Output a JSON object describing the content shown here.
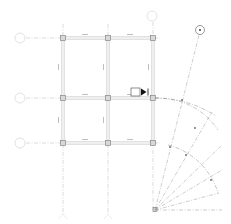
{
  "drawing": {
    "type": "structural-grid-plan",
    "colors": {
      "grid_line": "#b8b8b8",
      "beam": "#c8c8c8",
      "column": "#8a8a8a",
      "bubble": "#cccccc",
      "marker": "#222222",
      "radial": "#9a9a9a"
    },
    "grid_rows": [
      {
        "id": "row-1",
        "label": "",
        "y": 38
      },
      {
        "id": "row-2",
        "label": "",
        "y": 98
      },
      {
        "id": "row-3",
        "label": "",
        "y": 143
      }
    ],
    "grid_columns": [
      {
        "id": "col-1",
        "label": "",
        "x": 63
      },
      {
        "id": "col-2",
        "label": "",
        "x": 108
      },
      {
        "id": "col-3",
        "label": "",
        "x": 153
      }
    ],
    "top_bubble": {
      "label": "",
      "x": 153,
      "y": 16
    },
    "rotated_bubble": {
      "label": "•",
      "x": 200,
      "y": 30
    },
    "beam_labels": {
      "top_left": "—",
      "top_right": "—",
      "mid_left": "—",
      "mid_right": "—",
      "bottom_left": "—",
      "bottom_right": "—"
    },
    "section_marker": {
      "label": "",
      "x": 133,
      "y": 93
    },
    "radial_origin": {
      "x": 155,
      "y": 210
    },
    "radial_arcs": [
      {
        "radius": 115
      },
      {
        "radius": 85
      }
    ]
  }
}
